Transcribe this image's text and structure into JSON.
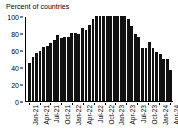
{
  "chart_data": {
    "type": "bar",
    "title": "Percent of countries",
    "xlabel": "",
    "ylabel": "",
    "ylim": [
      0,
      100
    ],
    "yticks": [
      0,
      20,
      40,
      60,
      80,
      100
    ],
    "grid": false,
    "legend": null,
    "bar_color": "#111111",
    "categories": [
      "Jan-21",
      "Feb-21",
      "Mar-21",
      "Apr-21",
      "May-21",
      "Jun-21",
      "Jul-21",
      "Aug-21",
      "Sep-21",
      "Oct-21",
      "Nov-21",
      "Dec-21",
      "Jan-22",
      "Feb-22",
      "Mar-22",
      "Apr-22",
      "May-22",
      "Jun-22",
      "Jul-22",
      "Aug-22",
      "Sep-22",
      "Oct-22",
      "Nov-22",
      "Dec-22",
      "Jan-23",
      "Feb-23",
      "Mar-23",
      "Apr-23",
      "May-23",
      "Jun-23",
      "Jul-23",
      "Aug-23",
      "Sep-23",
      "Oct-23",
      "Nov-23",
      "Dec-23",
      "Jan-24",
      "Feb-24",
      "Mar-24",
      "Apr-24",
      "May-24"
    ],
    "values": [
      45,
      52,
      57,
      59,
      63,
      65,
      68,
      72,
      78,
      74,
      75,
      75,
      80,
      80,
      79,
      86,
      84,
      90,
      96,
      100,
      100,
      100,
      100,
      100,
      100,
      100,
      100,
      100,
      96,
      88,
      79,
      75,
      62,
      62,
      69,
      62,
      58,
      55,
      49,
      49,
      37
    ],
    "xtick_labels": [
      "Jan-21",
      "Apr-21",
      "Jul-21",
      "Oct-21",
      "Jan-22",
      "Apr-22",
      "Jul-22",
      "Oct-22",
      "Jan-23",
      "Apr-23",
      "Jul-23",
      "Oct-23",
      "Jan-24",
      "Apr-24"
    ],
    "xtick_indices": [
      0,
      3,
      6,
      9,
      12,
      15,
      18,
      21,
      24,
      27,
      30,
      33,
      36,
      39
    ]
  }
}
